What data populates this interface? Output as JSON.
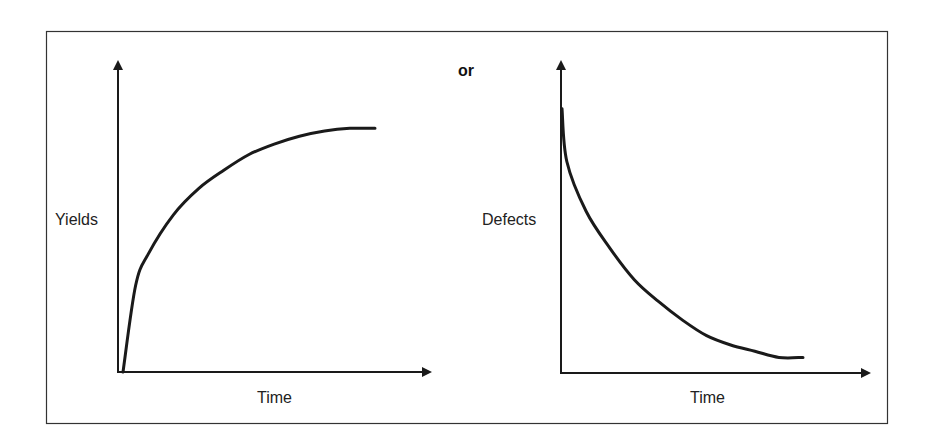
{
  "separator_text": "or",
  "chart_data": [
    {
      "type": "line",
      "title": "",
      "xlabel": "Time",
      "ylabel": "Yields",
      "description": "Concave increasing curve rising steeply from origin then leveling off",
      "xlim": [
        0,
        1
      ],
      "ylim": [
        0,
        1
      ],
      "series": [
        {
          "name": "Yields",
          "x": [
            0,
            0.05,
            0.1,
            0.2,
            0.3,
            0.4,
            0.5,
            0.6,
            0.7,
            0.8,
            0.9,
            1.0
          ],
          "y": [
            0,
            0.33,
            0.45,
            0.6,
            0.7,
            0.77,
            0.83,
            0.87,
            0.9,
            0.92,
            0.93,
            0.93
          ]
        }
      ],
      "grid": false,
      "ticks": false
    },
    {
      "type": "line",
      "title": "",
      "xlabel": "Time",
      "ylabel": "Defects",
      "description": "Convex decreasing curve falling steeply from high value then leveling off near zero",
      "xlim": [
        0,
        1
      ],
      "ylim": [
        0,
        1
      ],
      "series": [
        {
          "name": "Defects",
          "x": [
            0,
            0.02,
            0.1,
            0.2,
            0.3,
            0.4,
            0.5,
            0.6,
            0.7,
            0.8,
            0.9,
            1.0
          ],
          "y": [
            0.85,
            0.68,
            0.52,
            0.4,
            0.3,
            0.23,
            0.17,
            0.12,
            0.09,
            0.07,
            0.05,
            0.05
          ]
        }
      ],
      "grid": false,
      "ticks": false
    }
  ]
}
